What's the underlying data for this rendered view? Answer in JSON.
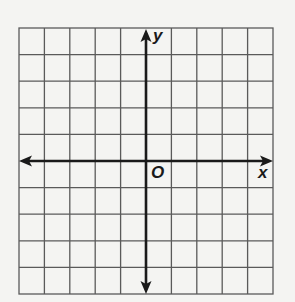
{
  "diagram": {
    "type": "coordinate-plane",
    "grid": {
      "columns": 10,
      "rows": 10
    },
    "labels": {
      "x_axis": "x",
      "y_axis": "y",
      "origin": "O"
    },
    "colors": {
      "grid": "#555555",
      "axis": "#1a1a1a",
      "background": "#f4f4f2"
    }
  }
}
